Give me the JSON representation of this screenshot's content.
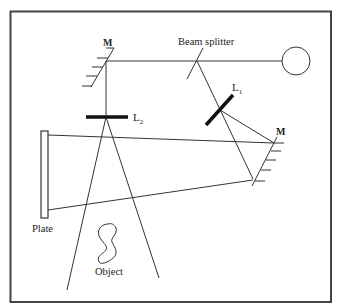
{
  "diagram": {
    "type": "holography-setup",
    "labels": {
      "mirror_top_left": "M",
      "beam_splitter": "Beam splitter",
      "lens_1": "L",
      "lens_1_sub": "1",
      "lens_2": "L",
      "lens_2_sub": "2",
      "mirror_right": "M",
      "plate": "Plate",
      "object": "Object"
    },
    "components": [
      {
        "id": "laser",
        "shape": "circle"
      },
      {
        "id": "beam_splitter",
        "shape": "line"
      },
      {
        "id": "mirror_top_left",
        "shape": "hatched-line"
      },
      {
        "id": "mirror_right",
        "shape": "hatched-line"
      },
      {
        "id": "lens_1",
        "shape": "thick-line"
      },
      {
        "id": "lens_2",
        "shape": "thick-line"
      },
      {
        "id": "plate",
        "shape": "rectangle"
      },
      {
        "id": "object",
        "shape": "blob"
      }
    ],
    "colors": {
      "stroke": "#333333",
      "frame": "#444444",
      "background": "#ffffff"
    }
  }
}
